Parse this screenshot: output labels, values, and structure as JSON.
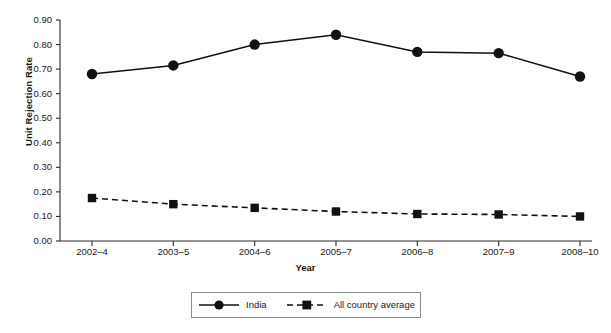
{
  "chart_data": {
    "type": "line",
    "title": "",
    "xlabel": "Year",
    "ylabel": "Unit Rejection Rate",
    "categories": [
      "2002–4",
      "2003–5",
      "2004–6",
      "2005–7",
      "2006–8",
      "2007–9",
      "2008–10"
    ],
    "ylim": [
      0.0,
      0.9
    ],
    "ytick_labels": [
      "0.00",
      "0.10",
      "0.20",
      "0.30",
      "0.40",
      "0.50",
      "0.60",
      "0.70",
      "0.80",
      "0.90"
    ],
    "ytick_values": [
      0.0,
      0.1,
      0.2,
      0.3,
      0.4,
      0.5,
      0.6,
      0.7,
      0.8,
      0.9
    ],
    "grid": false,
    "legend_position": "bottom",
    "series": [
      {
        "name": "India",
        "marker": "circle",
        "line_style": "solid",
        "color": "#111111",
        "values": [
          0.68,
          0.715,
          0.8,
          0.84,
          0.77,
          0.765,
          0.67
        ]
      },
      {
        "name": "All country average",
        "marker": "square",
        "line_style": "dashed",
        "color": "#111111",
        "values": [
          0.175,
          0.15,
          0.135,
          0.12,
          0.11,
          0.108,
          0.1
        ]
      }
    ]
  },
  "legend": {
    "items": [
      {
        "label": "India"
      },
      {
        "label": "All country average"
      }
    ]
  },
  "axes": {
    "x_title": "Year",
    "y_title": "Unit Rejection Rate"
  }
}
